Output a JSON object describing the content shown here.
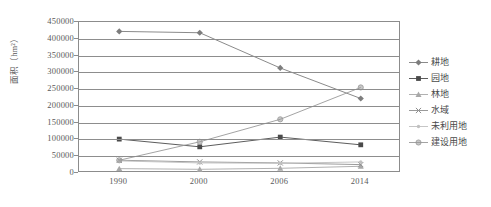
{
  "chart_data": {
    "type": "line",
    "title": "",
    "xlabel": "",
    "ylabel": "面积（hm²）",
    "categories": [
      "1990",
      "2000",
      "2006",
      "2014"
    ],
    "ylim": [
      0,
      450000
    ],
    "ytick_step": 50000,
    "yticks": [
      "450000",
      "400000",
      "350000",
      "300000",
      "250000",
      "200000",
      "150000",
      "100000",
      "50000",
      "0"
    ],
    "grid": "horizontal",
    "legend_position": "right",
    "series": [
      {
        "name": "耕地",
        "marker": "diamond",
        "color": "#7d7d7d",
        "values": [
          422000,
          418000,
          313000,
          222000
        ]
      },
      {
        "name": "园地",
        "marker": "square",
        "color": "#4a4a4a",
        "values": [
          101000,
          78000,
          107000,
          84000
        ]
      },
      {
        "name": "林地",
        "marker": "triangle",
        "color": "#a8a8a8",
        "values": [
          13000,
          11000,
          14000,
          20000
        ]
      },
      {
        "name": "水域",
        "marker": "cross",
        "color": "#8f8f8f",
        "values": [
          38000,
          33000,
          30000,
          25000
        ]
      },
      {
        "name": "未利用地",
        "marker": "dot",
        "color": "#c0c0c0",
        "values": [
          36000,
          30000,
          29000,
          33000
        ]
      },
      {
        "name": "建设用地",
        "marker": "circle",
        "color": "#999999",
        "values": [
          38000,
          93000,
          160000,
          255000
        ]
      }
    ]
  },
  "legend": {
    "items": [
      {
        "label": "耕地"
      },
      {
        "label": "园地"
      },
      {
        "label": "林地"
      },
      {
        "label": "水域"
      },
      {
        "label": "未利用地"
      },
      {
        "label": "建设用地"
      }
    ]
  }
}
